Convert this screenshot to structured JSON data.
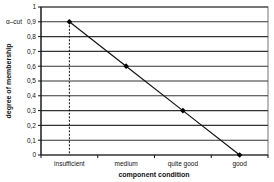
{
  "chart_data": {
    "type": "line",
    "title": "",
    "xlabel": "component condition",
    "ylabel": "degree of membership",
    "categories": [
      "insufficient",
      "medium",
      "quite good",
      "good"
    ],
    "series": [
      {
        "name": "membership",
        "values": [
          0.9,
          0.6,
          0.3,
          0.0
        ]
      }
    ],
    "ylim": [
      0,
      1
    ],
    "yticks": [
      0,
      0.1,
      0.2,
      0.3,
      0.4,
      0.5,
      0.6,
      0.7,
      0.8,
      0.9,
      1
    ],
    "ytick_labels": [
      "0",
      "0,1",
      "0,2",
      "0,3",
      "0,4",
      "0,5",
      "0,6",
      "0,7",
      "0,8",
      "0,9",
      "1"
    ],
    "grid": true,
    "legend": "none",
    "annotations": [
      {
        "text": "α–cut",
        "y": 0.9,
        "position": "left of y tick 0,9"
      },
      {
        "type": "dashed-vertical-line",
        "x": "insufficient",
        "from": 0,
        "to": 0.9
      }
    ],
    "colors": {
      "line": "#111111",
      "grid": "#333333",
      "marker": "#000000"
    }
  }
}
